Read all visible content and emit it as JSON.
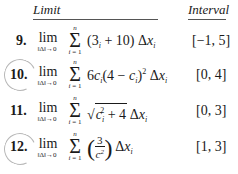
{
  "header": {
    "limit": "Limit",
    "interval": "Interval"
  },
  "lim_word": "lim",
  "lim_sub": "‖Δ‖→0",
  "sum_top": "n",
  "sum_bottom_var": "i",
  "sum_bottom_eq": " = 1",
  "problems": [
    {
      "number": "9.",
      "circled": false,
      "expression": "(3c_i + 10) Δx_i",
      "interval": "[−1, 5]"
    },
    {
      "number": "10.",
      "circled": true,
      "expression": "6c_i(4 − c_i)^2 Δx_i",
      "interval": "[0, 4]"
    },
    {
      "number": "11.",
      "circled": false,
      "expression": "sqrt(c_i^2 + 4) Δx_i",
      "interval": "[0, 3]"
    },
    {
      "number": "12.",
      "circled": true,
      "expression": "(3 / c_i^2) Δx_i",
      "interval": "[1, 3]"
    }
  ],
  "expr_parts": {
    "p9": {
      "open": "(3",
      "c": "c",
      "i": "i",
      "rest": " + 10) Δ",
      "x": "x"
    },
    "p10": {
      "lead": "6",
      "c": "c",
      "i": "i",
      "mid": "(4 − ",
      "close": ")",
      "sq": "2",
      "d": " Δ",
      "x": "x"
    },
    "p11": {
      "c": "c",
      "i": "i",
      "sq": "2",
      "plus": " + 4",
      "d": " Δ",
      "x": "x"
    },
    "p12": {
      "num": "3",
      "c": "c",
      "i": "i",
      "sq": "2",
      "lp": "(",
      "rp": ")",
      "d": " Δ",
      "x": "x"
    }
  }
}
